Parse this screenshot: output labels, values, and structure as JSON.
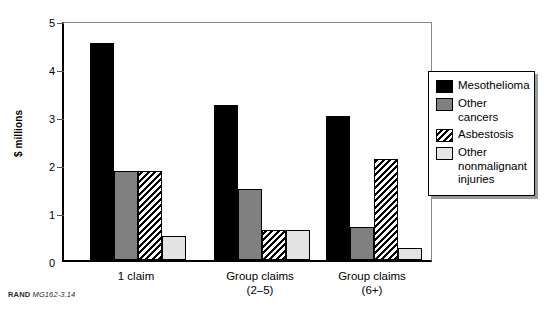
{
  "chart_data": {
    "type": "bar",
    "title": "",
    "xlabel": "",
    "ylabel": "$ millions",
    "ylim": [
      0,
      5
    ],
    "yticks": [
      0,
      1,
      2,
      3,
      4,
      5
    ],
    "ytick_labels": [
      "0",
      "1",
      "2",
      "3",
      "4",
      "5"
    ],
    "grid": false,
    "legend_position": "right",
    "categories": [
      "1 claim",
      "Group claims (2–5)",
      "Group claims (6+)"
    ],
    "category_lines": [
      [
        "1 claim"
      ],
      [
        "Group claims",
        "(2–5)"
      ],
      [
        "Group claims",
        "(6+)"
      ]
    ],
    "series": [
      {
        "name": "Mesothelioma",
        "fill": "black",
        "values": [
          4.52,
          3.22,
          3.0
        ]
      },
      {
        "name": "Other cancers",
        "fill": "gray",
        "values": [
          1.85,
          1.47,
          0.68
        ]
      },
      {
        "name": "Asbestosis",
        "fill": "hatch",
        "values": [
          1.85,
          0.62,
          2.1
        ]
      },
      {
        "name": "Other nonmalignant injuries",
        "fill": "light",
        "values": [
          0.5,
          0.62,
          0.25
        ]
      }
    ]
  },
  "legend": {
    "entries": [
      {
        "label": "Mesothelioma",
        "fill": "black"
      },
      {
        "label": "Other cancers",
        "fill": "gray"
      },
      {
        "label": "Asbestosis",
        "fill": "hatch"
      },
      {
        "label": "Other nonmalignant injuries",
        "fill": "light"
      }
    ]
  },
  "footnote": {
    "organization": "RAND",
    "code": "MG162-3.14"
  }
}
